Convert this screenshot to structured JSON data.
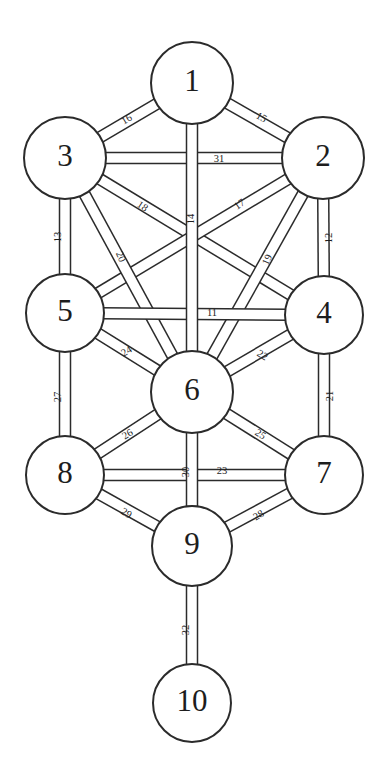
{
  "diagram": {
    "type": "node-link-diagram",
    "background_color": "#ffffff",
    "stroke_color": "#2b2b2b",
    "text_color": "#1d1d1d",
    "width": 385,
    "height": 782
  },
  "nodes": [
    {
      "id": "n1",
      "label": "1",
      "cx": 192,
      "cy": 83,
      "r": 41
    },
    {
      "id": "n2",
      "label": "2",
      "cx": 323,
      "cy": 158,
      "r": 41
    },
    {
      "id": "n3",
      "label": "3",
      "cx": 65,
      "cy": 158,
      "r": 41
    },
    {
      "id": "n4",
      "label": "4",
      "cx": 324,
      "cy": 315,
      "r": 39
    },
    {
      "id": "n5",
      "label": "5",
      "cx": 65,
      "cy": 313,
      "r": 39
    },
    {
      "id": "n6",
      "label": "6",
      "cx": 192,
      "cy": 392,
      "r": 41
    },
    {
      "id": "n7",
      "label": "7",
      "cx": 324,
      "cy": 475,
      "r": 39
    },
    {
      "id": "n8",
      "label": "8",
      "cx": 65,
      "cy": 475,
      "r": 39
    },
    {
      "id": "n9",
      "label": "9",
      "cx": 192,
      "cy": 546,
      "r": 40
    },
    {
      "id": "n10",
      "label": "10",
      "cx": 192,
      "cy": 703,
      "r": 39
    }
  ],
  "paths": [
    {
      "id": "p11",
      "label": "11",
      "from": "n5",
      "to": "n4",
      "label_x": 212,
      "label_y": 314,
      "label_rot": 0
    },
    {
      "id": "p12",
      "label": "12",
      "from": "n2",
      "to": "n4",
      "label_x": 330,
      "label_y": 238,
      "label_rot": -90
    },
    {
      "id": "p13",
      "label": "13",
      "from": "n3",
      "to": "n5",
      "label_x": 59,
      "label_y": 237,
      "label_rot": -90
    },
    {
      "id": "p14",
      "label": "14",
      "from": "n1",
      "to": "n6",
      "label_x": 192,
      "label_y": 219,
      "label_rot": -90
    },
    {
      "id": "p15",
      "label": "15",
      "from": "n1",
      "to": "n2",
      "label_x": 261,
      "label_y": 118,
      "label_rot": 30
    },
    {
      "id": "p16",
      "label": "16",
      "from": "n1",
      "to": "n3",
      "label_x": 127,
      "label_y": 120,
      "label_rot": -30
    },
    {
      "id": "p17",
      "label": "17",
      "from": "n2",
      "to": "n5",
      "label_x": 240,
      "label_y": 205,
      "label_rot": -34
    },
    {
      "id": "p18",
      "label": "18",
      "from": "n3",
      "to": "n4",
      "label_x": 142,
      "label_y": 207,
      "label_rot": 34
    },
    {
      "id": "p19",
      "label": "19",
      "from": "n2",
      "to": "n6",
      "label_x": 268,
      "label_y": 260,
      "label_rot": -66
    },
    {
      "id": "p20",
      "label": "20",
      "from": "n3",
      "to": "n6",
      "label_x": 120,
      "label_y": 257,
      "label_rot": 66
    },
    {
      "id": "p21",
      "label": "21",
      "from": "n4",
      "to": "n7",
      "label_x": 331,
      "label_y": 396,
      "label_rot": -90
    },
    {
      "id": "p22",
      "label": "22",
      "from": "n4",
      "to": "n6",
      "label_x": 262,
      "label_y": 356,
      "label_rot": 31
    },
    {
      "id": "p23",
      "label": "23",
      "from": "n8",
      "to": "n7",
      "label_x": 222,
      "label_y": 472,
      "label_rot": 0
    },
    {
      "id": "p24",
      "label": "24",
      "from": "n5",
      "to": "n6",
      "label_x": 127,
      "label_y": 352,
      "label_rot": -31
    },
    {
      "id": "p25",
      "label": "25",
      "from": "n6",
      "to": "n7",
      "label_x": 260,
      "label_y": 435,
      "label_rot": 32
    },
    {
      "id": "p26",
      "label": "26",
      "from": "n5",
      "to": "n6",
      "label_x": 128,
      "label_y": 435,
      "label_rot": -32
    },
    {
      "id": "p27",
      "label": "27",
      "from": "n5",
      "to": "n8",
      "label_x": 59,
      "label_y": 397,
      "label_rot": -90
    },
    {
      "id": "p28",
      "label": "28",
      "from": "n9",
      "to": "n7",
      "label_x": 259,
      "label_y": 516,
      "label_rot": -31
    },
    {
      "id": "p29",
      "label": "29",
      "from": "n8",
      "to": "n9",
      "label_x": 126,
      "label_y": 514,
      "label_rot": 31
    },
    {
      "id": "p30",
      "label": "30",
      "from": "n6",
      "to": "n9",
      "label_x": 187,
      "label_y": 472,
      "label_rot": -90
    },
    {
      "id": "p31",
      "label": "31",
      "from": "n3",
      "to": "n2",
      "label_x": 219,
      "label_y": 160,
      "label_rot": 0
    },
    {
      "id": "p32",
      "label": "32",
      "from": "n9",
      "to": "n10",
      "label_x": 187,
      "label_y": 630,
      "label_rot": -90
    }
  ],
  "edges": [
    {
      "id": "e16",
      "from": "n1",
      "to": "n3",
      "path_label": "16"
    },
    {
      "id": "e15",
      "from": "n1",
      "to": "n2",
      "path_label": "15"
    },
    {
      "id": "e14",
      "from": "n1",
      "to": "n6",
      "path_label": "14"
    },
    {
      "id": "e31",
      "from": "n3",
      "to": "n2",
      "path_label": "31"
    },
    {
      "id": "e13",
      "from": "n3",
      "to": "n5",
      "path_label": "13"
    },
    {
      "id": "e12",
      "from": "n2",
      "to": "n4",
      "path_label": "12"
    },
    {
      "id": "e18",
      "from": "n3",
      "to": "n4",
      "path_label": "18"
    },
    {
      "id": "e17",
      "from": "n2",
      "to": "n5",
      "path_label": "17"
    },
    {
      "id": "e20",
      "from": "n3",
      "to": "n6",
      "path_label": "20"
    },
    {
      "id": "e19",
      "from": "n2",
      "to": "n6",
      "path_label": "19"
    },
    {
      "id": "e11",
      "from": "n5",
      "to": "n4",
      "path_label": "11"
    },
    {
      "id": "e24",
      "from": "n5",
      "to": "n6",
      "path_label": "24"
    },
    {
      "id": "e22",
      "from": "n4",
      "to": "n6",
      "path_label": "22"
    },
    {
      "id": "e27",
      "from": "n5",
      "to": "n8",
      "path_label": "27"
    },
    {
      "id": "e21",
      "from": "n4",
      "to": "n7",
      "path_label": "21"
    },
    {
      "id": "e26",
      "from": "n8",
      "to": "n6",
      "path_label": "26"
    },
    {
      "id": "e25",
      "from": "n6",
      "to": "n7",
      "path_label": "25"
    },
    {
      "id": "e23",
      "from": "n8",
      "to": "n7",
      "path_label": "23"
    },
    {
      "id": "e30",
      "from": "n6",
      "to": "n9",
      "path_label": "30"
    },
    {
      "id": "e29",
      "from": "n8",
      "to": "n9",
      "path_label": "29"
    },
    {
      "id": "e28",
      "from": "n9",
      "to": "n7",
      "path_label": "28"
    },
    {
      "id": "e32",
      "from": "n9",
      "to": "n10",
      "path_label": "32"
    }
  ],
  "geometry": {
    "band_width": 11,
    "draw_order": [
      "e16",
      "e15",
      "e13",
      "e12",
      "e18",
      "e17",
      "e20",
      "e19",
      "e11",
      "e24",
      "e22",
      "e27",
      "e21",
      "e26",
      "e25",
      "e29",
      "e28",
      "e31",
      "e23",
      "e14",
      "e30",
      "e32"
    ]
  }
}
